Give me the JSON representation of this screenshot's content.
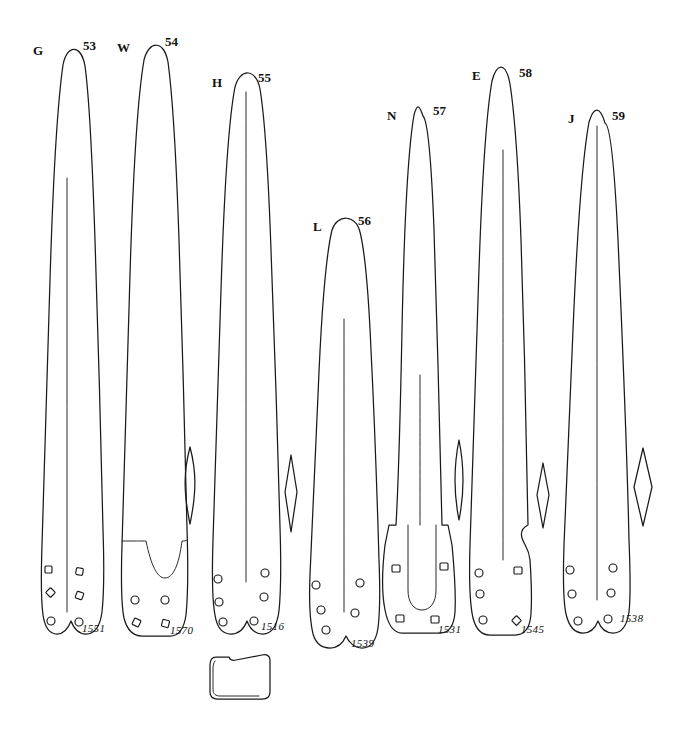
{
  "plate": {
    "title": "Archaeological plate of bronze spearhead / blade outline drawings",
    "background_color": "#ffffff",
    "ink_color": "#1a1a1a",
    "width": 677,
    "height": 734
  },
  "artifacts": [
    {
      "letter": "G",
      "figure": "53",
      "catalog": "1551",
      "letter_pos": {
        "x": 33,
        "y": 43
      },
      "fig_pos": {
        "x": 83,
        "y": 38
      },
      "cat_pos": {
        "x": 82,
        "y": 622
      },
      "section_shape": "none",
      "rivet_count": 6
    },
    {
      "letter": "W",
      "figure": "54",
      "catalog": "1570",
      "letter_pos": {
        "x": 117,
        "y": 40
      },
      "fig_pos": {
        "x": 165,
        "y": 34
      },
      "cat_pos": {
        "x": 170,
        "y": 624
      },
      "section_shape": "lenticular",
      "rivet_count": 4
    },
    {
      "letter": "H",
      "figure": "55",
      "catalog": "1516",
      "letter_pos": {
        "x": 212,
        "y": 75
      },
      "fig_pos": {
        "x": 258,
        "y": 70
      },
      "cat_pos": {
        "x": 261,
        "y": 620
      },
      "section_shape": "diamond",
      "rivet_count": 6
    },
    {
      "letter": "L",
      "figure": "56",
      "catalog": "1539",
      "letter_pos": {
        "x": 313,
        "y": 219
      },
      "fig_pos": {
        "x": 358,
        "y": 213
      },
      "cat_pos": {
        "x": 351,
        "y": 637
      },
      "section_shape": "none",
      "rivet_count": 5
    },
    {
      "letter": "N",
      "figure": "57",
      "catalog": "1531",
      "letter_pos": {
        "x": 387,
        "y": 108
      },
      "fig_pos": {
        "x": 433,
        "y": 103
      },
      "cat_pos": {
        "x": 438,
        "y": 623
      },
      "section_shape": "lenticular",
      "rivet_count": 4
    },
    {
      "letter": "E",
      "figure": "58",
      "catalog": "1545",
      "letter_pos": {
        "x": 472,
        "y": 68
      },
      "fig_pos": {
        "x": 519,
        "y": 65
      },
      "cat_pos": {
        "x": 521,
        "y": 623
      },
      "section_shape": "diamond",
      "rivet_count": 6
    },
    {
      "letter": "J",
      "figure": "59",
      "catalog": "1538",
      "letter_pos": {
        "x": 568,
        "y": 111
      },
      "fig_pos": {
        "x": 612,
        "y": 108
      },
      "cat_pos": {
        "x": 620,
        "y": 612
      },
      "section_shape": "diamond",
      "rivet_count": 6
    }
  ],
  "extra_profile": {
    "name": "socket-cross-section",
    "description": "open-topped rectangular socket profile below figure 55"
  }
}
